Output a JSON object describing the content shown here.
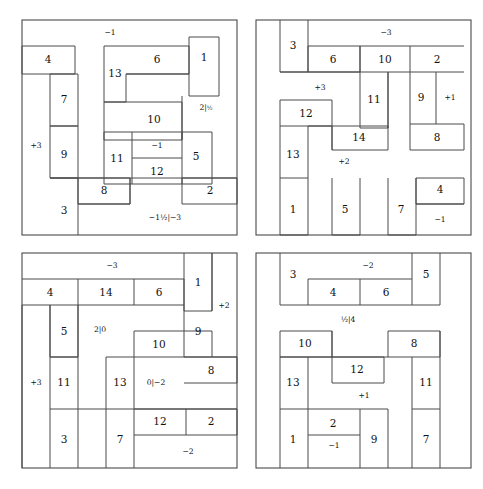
{
  "figure": {
    "type": "diagram",
    "panel_count": 4,
    "stroke_color": "#4a4a4a",
    "text_color": "#111111",
    "background": "#ffffff"
  },
  "panels": [
    {
      "id": "panel-top-left",
      "position": "top-left",
      "box": {
        "x": 22,
        "y": 20,
        "w": 215,
        "h": 215
      },
      "pieces": [
        {
          "label": "1",
          "x": 189,
          "y": 46,
          "w": 30,
          "h": 50
        },
        {
          "label": "4",
          "x": 22,
          "y": 46,
          "w": 53,
          "h": 28
        },
        {
          "label": "6",
          "x": 126,
          "y": 46,
          "w": 63,
          "h": 28
        },
        {
          "label": "13",
          "x": 104,
          "y": 46,
          "w": 22,
          "h": 56
        },
        {
          "label": "7",
          "x": 50,
          "y": 74,
          "w": 28,
          "h": 52
        },
        {
          "label": "10",
          "x": 126,
          "y": 102,
          "w": 56,
          "h": 38
        },
        {
          "label": "+3",
          "x": 22,
          "y": 74,
          "w": 28,
          "h": 100,
          "annotation": true
        },
        {
          "label": "9",
          "x": 50,
          "y": 126,
          "w": 28,
          "h": 52
        },
        {
          "label": "11",
          "x": 104,
          "y": 132,
          "w": 28,
          "h": 52
        },
        {
          "label": "12",
          "x": 132,
          "y": 158,
          "w": 50,
          "h": 26
        },
        {
          "label": "5",
          "x": 182,
          "y": 132,
          "w": 30,
          "h": 52
        },
        {
          "label": "8",
          "x": 78,
          "y": 178,
          "w": 52,
          "h": 26
        },
        {
          "label": "3",
          "x": 50,
          "y": 178,
          "w": 28,
          "h": 57
        },
        {
          "label": "2",
          "x": 182,
          "y": 178,
          "w": 55,
          "h": 26
        }
      ],
      "labels": [
        {
          "text": "−1",
          "x": 110,
          "y": 33,
          "kind": "annot"
        },
        {
          "text": "2|",
          "frac": "½",
          "x": 206,
          "y": 108,
          "kind": "annot"
        },
        {
          "text": "−1",
          "x": 157,
          "y": 146,
          "kind": "annot"
        },
        {
          "text": "−1½|−3",
          "x": 165,
          "y": 218,
          "kind": "annot"
        },
        {
          "text": "+3",
          "x": 36,
          "y": 146,
          "kind": "annot"
        }
      ]
    },
    {
      "id": "panel-top-right",
      "position": "top-right",
      "box": {
        "x": 256,
        "y": 20,
        "w": 215,
        "h": 215
      },
      "pieces": [
        {
          "label": "3",
          "x": 280,
          "y": 20,
          "w": 28,
          "h": 52
        },
        {
          "label": "6",
          "x": 308,
          "y": 46,
          "w": 52,
          "h": 26
        },
        {
          "label": "10",
          "x": 360,
          "y": 46,
          "w": 50,
          "h": 26
        },
        {
          "label": "2",
          "x": 410,
          "y": 46,
          "w": 54,
          "h": 26
        },
        {
          "label": "11",
          "x": 360,
          "y": 72,
          "w": 28,
          "h": 56
        },
        {
          "label": "9",
          "x": 410,
          "y": 72,
          "w": 26,
          "h": 52
        },
        {
          "label": "+1",
          "x": 436,
          "y": 72,
          "w": 28,
          "h": 52,
          "annotation": true
        },
        {
          "label": "12",
          "x": 280,
          "y": 100,
          "w": 52,
          "h": 26
        },
        {
          "label": "14",
          "x": 332,
          "y": 124,
          "w": 56,
          "h": 26
        },
        {
          "label": "8",
          "x": 410,
          "y": 124,
          "w": 54,
          "h": 26
        },
        {
          "label": "13",
          "x": 280,
          "y": 126,
          "w": 28,
          "h": 52
        },
        {
          "label": "1",
          "x": 280,
          "y": 178,
          "w": 28,
          "h": 57
        },
        {
          "label": "5",
          "x": 332,
          "y": 178,
          "w": 28,
          "h": 57
        },
        {
          "label": "7",
          "x": 388,
          "y": 178,
          "w": 28,
          "h": 57
        },
        {
          "label": "4",
          "x": 416,
          "y": 178,
          "w": 48,
          "h": 26
        },
        {
          "label": "−1",
          "x": 416,
          "y": 204,
          "w": 48,
          "h": 31,
          "annotation": true
        }
      ],
      "labels": [
        {
          "text": "−3",
          "x": 386,
          "y": 33,
          "kind": "annot"
        },
        {
          "text": "+3",
          "x": 320,
          "y": 88,
          "kind": "annot"
        },
        {
          "text": "+2",
          "x": 344,
          "y": 162,
          "kind": "annot"
        },
        {
          "text": "−1",
          "x": 440,
          "y": 220,
          "kind": "annot"
        },
        {
          "text": "+1",
          "x": 450,
          "y": 98,
          "kind": "annot"
        }
      ]
    },
    {
      "id": "panel-bottom-left",
      "position": "bottom-left",
      "box": {
        "x": 22,
        "y": 253,
        "w": 215,
        "h": 215
      },
      "pieces": [
        {
          "label": "1",
          "x": 184,
          "y": 253,
          "w": 28,
          "h": 52
        },
        {
          "label": "+2",
          "x": 212,
          "y": 253,
          "w": 25,
          "h": 58,
          "annotation": true
        },
        {
          "label": "4",
          "x": 22,
          "y": 279,
          "w": 56,
          "h": 26
        },
        {
          "label": "14",
          "x": 78,
          "y": 279,
          "w": 56,
          "h": 26
        },
        {
          "label": "6",
          "x": 134,
          "y": 279,
          "w": 50,
          "h": 26
        },
        {
          "label": "5",
          "x": 50,
          "y": 305,
          "w": 28,
          "h": 52
        },
        {
          "label": "9",
          "x": 184,
          "y": 305,
          "w": 28,
          "h": 52
        },
        {
          "label": "10",
          "x": 134,
          "y": 331,
          "w": 50,
          "h": 26
        },
        {
          "label": "+3",
          "x": 22,
          "y": 305,
          "w": 28,
          "h": 110,
          "annotation": true
        },
        {
          "label": "11",
          "x": 50,
          "y": 357,
          "w": 28,
          "h": 52
        },
        {
          "label": "8",
          "x": 184,
          "y": 357,
          "w": 53,
          "h": 26
        },
        {
          "label": "13",
          "x": 106,
          "y": 357,
          "w": 28,
          "h": 52
        },
        {
          "label": "3",
          "x": 50,
          "y": 409,
          "w": 28,
          "h": 59
        },
        {
          "label": "7",
          "x": 106,
          "y": 409,
          "w": 28,
          "h": 59
        },
        {
          "label": "12",
          "x": 134,
          "y": 409,
          "w": 52,
          "h": 26
        },
        {
          "label": "2",
          "x": 186,
          "y": 409,
          "w": 51,
          "h": 26
        }
      ],
      "labels": [
        {
          "text": "−3",
          "x": 112,
          "y": 266,
          "kind": "annot"
        },
        {
          "text": "2|0",
          "x": 100,
          "y": 330,
          "kind": "annot"
        },
        {
          "text": "0|−2",
          "x": 156,
          "y": 383,
          "kind": "annot"
        },
        {
          "text": "−2",
          "x": 188,
          "y": 452,
          "kind": "annot"
        },
        {
          "text": "+2",
          "x": 224,
          "y": 306,
          "kind": "annot"
        },
        {
          "text": "+3",
          "x": 36,
          "y": 383,
          "kind": "annot"
        }
      ]
    },
    {
      "id": "panel-bottom-right",
      "position": "bottom-right",
      "box": {
        "x": 256,
        "y": 253,
        "w": 215,
        "h": 215
      },
      "pieces": [
        {
          "label": "3",
          "x": 280,
          "y": 253,
          "w": 28,
          "h": 52
        },
        {
          "label": "4",
          "x": 308,
          "y": 279,
          "w": 52,
          "h": 26
        },
        {
          "label": "6",
          "x": 360,
          "y": 279,
          "w": 52,
          "h": 26
        },
        {
          "label": "5",
          "x": 412,
          "y": 253,
          "w": 28,
          "h": 52
        },
        {
          "label": "10",
          "x": 280,
          "y": 331,
          "w": 52,
          "h": 26
        },
        {
          "label": "8",
          "x": 388,
          "y": 331,
          "w": 52,
          "h": 26
        },
        {
          "label": "12",
          "x": 332,
          "y": 357,
          "w": 52,
          "h": 26
        },
        {
          "label": "13",
          "x": 280,
          "y": 357,
          "w": 28,
          "h": 52
        },
        {
          "label": "11",
          "x": 412,
          "y": 357,
          "w": 28,
          "h": 52
        },
        {
          "label": "1",
          "x": 280,
          "y": 409,
          "w": 28,
          "h": 59
        },
        {
          "label": "2",
          "x": 308,
          "y": 409,
          "w": 52,
          "h": 26
        },
        {
          "label": "9",
          "x": 360,
          "y": 409,
          "w": 28,
          "h": 59
        },
        {
          "label": "7",
          "x": 412,
          "y": 409,
          "w": 28,
          "h": 59
        }
      ],
      "labels": [
        {
          "text": "−2",
          "x": 368,
          "y": 266,
          "kind": "annot"
        },
        {
          "text": "½|4",
          "x": 348,
          "y": 320,
          "kind": "annot"
        },
        {
          "text": "+1",
          "x": 364,
          "y": 396,
          "kind": "annot"
        },
        {
          "text": "−1",
          "x": 334,
          "y": 446,
          "kind": "annot"
        }
      ]
    }
  ]
}
